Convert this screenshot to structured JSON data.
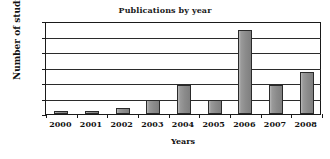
{
  "chart_data": {
    "type": "bar",
    "title": "Publications by year",
    "xlabel": "Years",
    "ylabel": "Number of studies",
    "categories": [
      "2000",
      "2001",
      "2002",
      "2003",
      "2004",
      "2005",
      "2006",
      "2007",
      "2008"
    ],
    "values": [
      2,
      2,
      4,
      9,
      19,
      9,
      54,
      19,
      27
    ],
    "series": [
      {
        "name": "Number of studies",
        "values": [
          2,
          2,
          4,
          9,
          19,
          9,
          54,
          19,
          27
        ]
      }
    ],
    "ylim": [
      0,
      60
    ],
    "ytick_labels": [
      "0",
      "10",
      "20",
      "30",
      "40",
      "50",
      "60"
    ],
    "ytick_values": [
      0,
      10,
      20,
      30,
      40,
      50,
      60
    ],
    "grid": "horizontal",
    "legend": "none",
    "bar_color": "#8b8b8b",
    "bar_border_color": "#2a2a2a",
    "axis_color": "#1a1a1a",
    "background_color": "#ffffff"
  }
}
